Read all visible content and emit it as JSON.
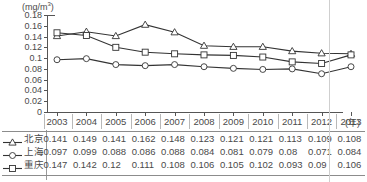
{
  "chart_data": {
    "type": "line",
    "title": "",
    "xlabel": "(年)",
    "ylabel": "(mg/m3)",
    "unit_label": "(mg/m",
    "unit_sup": "3",
    "unit_close": ")",
    "x_axis_suffix": "(年)",
    "categories": [
      "2003",
      "2004",
      "2005",
      "2006",
      "2007",
      "2008",
      "2009",
      "2010",
      "2011",
      "2012",
      "2013"
    ],
    "ylim": [
      0,
      0.18
    ],
    "ytick_labels": [
      "0.18",
      "0.16",
      "0.14",
      "0.12",
      "0.1",
      "0.08",
      "0.06",
      "0.04",
      "0.02",
      "0"
    ],
    "ytick_values": [
      0.18,
      0.16,
      0.14,
      0.12,
      0.1,
      0.08,
      0.06,
      0.04,
      0.02,
      0
    ],
    "grid": false,
    "legend_position": "table-left",
    "series": [
      {
        "name": "北京",
        "marker": "triangle",
        "values": [
          0.141,
          0.149,
          0.141,
          0.162,
          0.148,
          0.123,
          0.121,
          0.121,
          0.113,
          0.109,
          0.108
        ],
        "labels": [
          "0.141",
          "0.149",
          "0.141",
          "0.162",
          "0.148",
          "0.123",
          "0.121",
          "0.121",
          "0.113",
          "0.109",
          "0.108"
        ]
      },
      {
        "name": "上海",
        "marker": "circle",
        "values": [
          0.097,
          0.099,
          0.088,
          0.086,
          0.088,
          0.084,
          0.081,
          0.079,
          0.08,
          0.071,
          0.084
        ],
        "labels": [
          "0.097",
          "0.099",
          "0.088",
          "0.086",
          "0.088",
          "0.084",
          "0.081",
          "0.079",
          "0.08",
          "0.071",
          "0.084"
        ]
      },
      {
        "name": "重庆",
        "marker": "square",
        "values": [
          0.147,
          0.142,
          0.12,
          0.111,
          0.108,
          0.106,
          0.105,
          0.102,
          0.093,
          0.09,
          0.106
        ],
        "labels": [
          "0.147",
          "0.142",
          "0.12",
          "0.111",
          "0.108",
          "0.106",
          "0.105",
          "0.102",
          "0.093",
          "0.09",
          "0.106"
        ]
      }
    ]
  },
  "colors": {
    "line": "#333333",
    "axis": "#555555",
    "text": "#4a4a4a",
    "rule": "#8c8c8c",
    "artifact": "#cfcfcf"
  }
}
